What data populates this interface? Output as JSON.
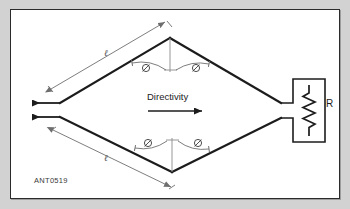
{
  "figure": {
    "id_label": "ANT0519",
    "type": "rhombic-antenna-diagram",
    "directivity_label": "Directivity",
    "resistor_label": "R",
    "length_label_top": "ℓ",
    "length_label_bottom": "ℓ",
    "angle_symbol": "Ø",
    "angles": [
      {
        "position": "top-left",
        "symbol": "Ø"
      },
      {
        "position": "top-right",
        "symbol": "Ø"
      },
      {
        "position": "bottom-left",
        "symbol": "Ø"
      },
      {
        "position": "bottom-right",
        "symbol": "Ø"
      }
    ],
    "colors": {
      "background": "#d2d2d2",
      "panel": "#ffffff",
      "border": "#2b2b2b",
      "conductor": "#1c1c1c",
      "dimension": "#6e6e6e",
      "text": "#1c1c1c",
      "label_text": "#3a3a3a"
    }
  }
}
